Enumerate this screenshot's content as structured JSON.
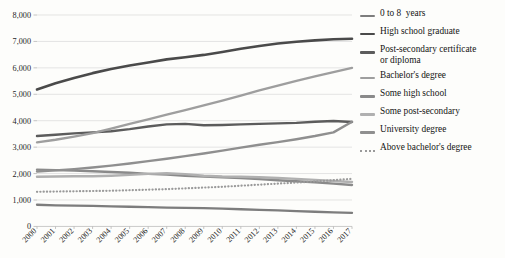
{
  "chart_data": {
    "type": "line",
    "title": "",
    "subtitle": "",
    "xlabel": "",
    "ylabel": "",
    "x": [
      "2000",
      "2001",
      "2002",
      "2003",
      "2004",
      "2005",
      "2006",
      "2007",
      "2008",
      "2009",
      "2010",
      "2011",
      "2012",
      "2013",
      "2014",
      "2015",
      "2016",
      "2017"
    ],
    "categories": [
      "2000",
      "2001",
      "2002",
      "2003",
      "2004",
      "2005",
      "2006",
      "2007",
      "2008",
      "2009",
      "2010",
      "2011",
      "2012",
      "2013",
      "2014",
      "2015",
      "2016",
      "2017"
    ],
    "ylim": [
      0,
      8000
    ],
    "yticks": [
      0,
      1000,
      2000,
      3000,
      4000,
      5000,
      6000,
      7000,
      8000
    ],
    "ytick_labels": [
      "0",
      "1,000",
      "2,000",
      "3,000",
      "4,000",
      "5,000",
      "6,000",
      "7,000",
      "8,000"
    ],
    "grid": true,
    "legend_position": "right",
    "xtick_rotation": -45,
    "series": [
      {
        "name": "0 to 8  years",
        "color": "#7d7d7d",
        "style": "solid",
        "width": 2.3,
        "values": [
          820,
          800,
          790,
          775,
          760,
          745,
          730,
          715,
          700,
          690,
          670,
          650,
          630,
          610,
          580,
          555,
          530,
          510
        ]
      },
      {
        "name": "High school graduate",
        "color": "#4a4a4a",
        "style": "solid",
        "width": 2.6,
        "values": [
          5180,
          5420,
          5620,
          5800,
          5960,
          6090,
          6200,
          6320,
          6400,
          6490,
          6600,
          6720,
          6830,
          6920,
          6990,
          7040,
          7080,
          7100
        ]
      },
      {
        "name": "Post-secondary certificate or diploma",
        "color": "#5c5c5c",
        "style": "solid",
        "width": 2.4,
        "values": [
          3420,
          3470,
          3520,
          3560,
          3600,
          3680,
          3780,
          3860,
          3880,
          3830,
          3840,
          3860,
          3880,
          3900,
          3920,
          3960,
          3990,
          3950
        ]
      },
      {
        "name": "Bachelor's degree",
        "color": "#9e9e9e",
        "style": "solid",
        "width": 2.4,
        "values": [
          3180,
          3280,
          3400,
          3530,
          3700,
          3880,
          4050,
          4230,
          4400,
          4580,
          4760,
          4950,
          5150,
          5330,
          5510,
          5680,
          5840,
          6000
        ]
      },
      {
        "name": "Some high school",
        "color": "#8a8a8a",
        "style": "solid",
        "width": 2.4,
        "values": [
          2150,
          2130,
          2110,
          2090,
          2060,
          2030,
          1990,
          1960,
          1920,
          1890,
          1860,
          1830,
          1790,
          1750,
          1710,
          1670,
          1620,
          1570
        ]
      },
      {
        "name": "Some post-secondary",
        "color": "#b0b0b0",
        "style": "solid",
        "width": 2.4,
        "values": [
          1880,
          1890,
          1900,
          1900,
          1920,
          1950,
          1990,
          2010,
          1980,
          1920,
          1890,
          1880,
          1860,
          1830,
          1800,
          1760,
          1720,
          1680
        ]
      },
      {
        "name": "University degree",
        "color": "#8f8f8f",
        "style": "solid",
        "width": 2.4,
        "values": [
          2080,
          2120,
          2170,
          2230,
          2300,
          2380,
          2470,
          2560,
          2660,
          2760,
          2870,
          2980,
          3090,
          3190,
          3300,
          3420,
          3560,
          3960
        ]
      },
      {
        "name": "Above bachelor's degree",
        "color": "#9a9a9a",
        "style": "dotted",
        "width": 2.2,
        "values": [
          1310,
          1320,
          1330,
          1340,
          1350,
          1370,
          1390,
          1410,
          1440,
          1470,
          1500,
          1540,
          1580,
          1620,
          1660,
          1700,
          1750,
          1800
        ]
      }
    ]
  },
  "legend": {
    "items": [
      {
        "label": "0 to 8  years",
        "color": "#7d7d7d",
        "style": "solid"
      },
      {
        "label": "High school graduate",
        "color": "#4a4a4a",
        "style": "solid"
      },
      {
        "label": "Post-secondary certificate\nor diploma",
        "color": "#5c5c5c",
        "style": "solid"
      },
      {
        "label": "Bachelor's degree",
        "color": "#9e9e9e",
        "style": "solid"
      },
      {
        "label": "Some high school",
        "color": "#8a8a8a",
        "style": "solid"
      },
      {
        "label": "Some post-secondary",
        "color": "#b0b0b0",
        "style": "solid"
      },
      {
        "label": "University degree",
        "color": "#8f8f8f",
        "style": "solid"
      },
      {
        "label": "Above bachelor's degree",
        "color": "#9a9a9a",
        "style": "dotted"
      }
    ]
  }
}
